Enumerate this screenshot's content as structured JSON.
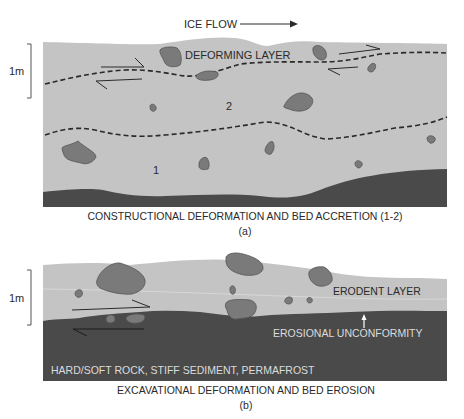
{
  "colors": {
    "background": "#ffffff",
    "till_light": "#c4c4c4",
    "bed_dark": "#4a4a4a",
    "clast": "#7a7a7a",
    "clast_outline": "#555555",
    "line": "#2a2a2a",
    "text_on_dark": "#dcdcdc"
  },
  "panel_a": {
    "flow_label": "ICE FLOW",
    "scale_label": "1m",
    "deforming_layer_label": "DEFORMING LAYER",
    "unit_2_label": "2",
    "unit_1_label": "1",
    "caption": "CONSTRUCTIONAL DEFORMATION AND BED ACCRETION (1-2)",
    "panel_letter": "(a)"
  },
  "panel_b": {
    "scale_label": "1m",
    "erodent_layer_label": "ERODENT LAYER",
    "unconformity_label": "EROSIONAL UNCONFORMITY",
    "substrate_label": "HARD/SOFT ROCK, STIFF SEDIMENT, PERMAFROST",
    "caption": "EXCAVATIONAL DEFORMATION AND BED EROSION",
    "panel_letter": "(b)"
  },
  "icons": {
    "flow_arrow": "arrow-right-icon",
    "shear_arrows": "half-arrow-icon",
    "unconformity_arrow": "arrow-up-icon",
    "scale_bar": "bracket-icon"
  }
}
